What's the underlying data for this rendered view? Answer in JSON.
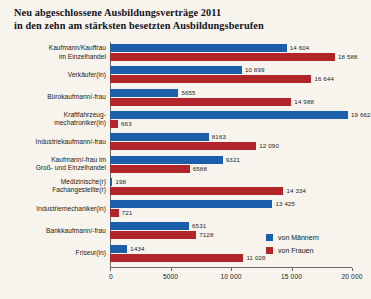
{
  "title": {
    "line1": "Neu abgeschlossene Ausbildungsverträge 2011",
    "line2": "in den zehn am stärksten besetzten Ausbildungsberufen"
  },
  "legend": {
    "position": "bottom-right",
    "items": [
      {
        "label": "von Männern",
        "color": "#1b5faa",
        "swatch_name": "legend-swatch-male"
      },
      {
        "label": "von Frauen",
        "color": "#b2262b",
        "swatch_name": "legend-swatch-female"
      }
    ]
  },
  "axis": {
    "ticks": [
      "0",
      "5000",
      "10 000",
      "15 000",
      "20 000"
    ],
    "tick_values": [
      0,
      5000,
      10000,
      15000,
      20000
    ]
  },
  "colors": {
    "male": "#1b5faa",
    "female": "#b2262b",
    "background": "#f6f4ec",
    "axis": "#6a6a68",
    "text": "#1a1a1a"
  },
  "chart_data": {
    "type": "bar",
    "orientation": "horizontal",
    "title": "Neu abgeschlossene Ausbildungsverträge 2011 in den zehn am stärksten besetzten Ausbildungsberufen",
    "xlabel": "",
    "ylabel": "",
    "xlim": [
      0,
      20000
    ],
    "grid": false,
    "legend_position": "bottom-right",
    "categories": [
      "Kaufmann/Kauffrau im Einzelhandel",
      "Verkäufer(in)",
      "Bürokaufmann/-frau",
      "Kraftfahrzeug-mechatroniker(in)",
      "Industriekaufmann/-frau",
      "Kaufmann/-frau im Groß- und Einzelhandel",
      "Medizinische(r) Fachangestellte(r)",
      "Industriemechaniker(in)",
      "Bankkaufmann/-frau",
      "Friseur(in)"
    ],
    "series": [
      {
        "name": "von Männern",
        "color": "#1b5faa",
        "values": [
          14604,
          10899,
          5655,
          19662,
          8163,
          9321,
          198,
          13425,
          6531,
          1434
        ]
      },
      {
        "name": "von Frauen",
        "color": "#b2262b",
        "values": [
          18588,
          16644,
          14988,
          663,
          12090,
          6588,
          14334,
          721,
          7128,
          11028
        ]
      }
    ]
  },
  "rows": [
    {
      "label_lines": [
        "Kaufmann/Kauffrau",
        "im Einzelhandel"
      ],
      "male": 14604,
      "female": 18588,
      "male_text": "14 604",
      "female_text": "18 588"
    },
    {
      "label_lines": [
        "Verkäufer(in)"
      ],
      "male": 10899,
      "female": 16644,
      "male_text": "10 899",
      "female_text": "16 644"
    },
    {
      "label_lines": [
        "Bürokaufmann/-frau"
      ],
      "male": 5655,
      "female": 14988,
      "male_text": "5655",
      "female_text": "14 988"
    },
    {
      "label_lines": [
        "Kraftfahrzeug-",
        "mechatroniker(in)"
      ],
      "male": 19662,
      "female": 663,
      "male_text": "19 662",
      "female_text": "663"
    },
    {
      "label_lines": [
        "Industriekaufmann/-frau"
      ],
      "male": 8163,
      "female": 12090,
      "male_text": "8163",
      "female_text": "12 090"
    },
    {
      "label_lines": [
        "Kaufmann/-frau im",
        "Groß- und Einzelhandel"
      ],
      "male": 9321,
      "female": 6588,
      "male_text": "9321",
      "female_text": "6588"
    },
    {
      "label_lines": [
        "Medizinische(r)",
        "Fachangestellte(r)"
      ],
      "male": 198,
      "female": 14334,
      "male_text": "198",
      "female_text": "14 334"
    },
    {
      "label_lines": [
        "Industriemechaniker(in)"
      ],
      "male": 13425,
      "female": 721,
      "male_text": "13 425",
      "female_text": "721"
    },
    {
      "label_lines": [
        "Bankkaufmann/-frau"
      ],
      "male": 6531,
      "female": 7128,
      "male_text": "6531",
      "female_text": "7128"
    },
    {
      "label_lines": [
        "Friseur(in)"
      ],
      "male": 1434,
      "female": 11028,
      "male_text": "1434",
      "female_text": "11 028"
    }
  ]
}
